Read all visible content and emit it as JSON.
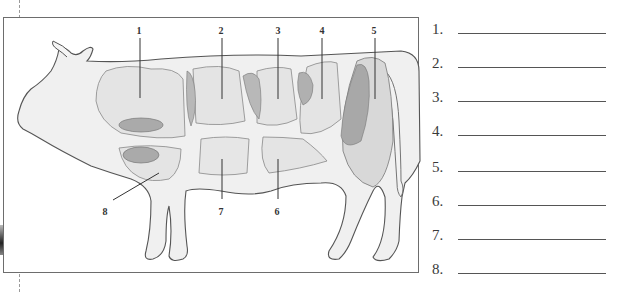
{
  "diagram": {
    "cut_labels": [
      {
        "id": "1",
        "text": "1",
        "x": 138,
        "y": 24
      },
      {
        "id": "2",
        "text": "2",
        "x": 220,
        "y": 24
      },
      {
        "id": "3",
        "text": "3",
        "x": 277,
        "y": 24
      },
      {
        "id": "4",
        "text": "4",
        "x": 321,
        "y": 24
      },
      {
        "id": "5",
        "text": "5",
        "x": 373,
        "y": 24
      },
      {
        "id": "6",
        "text": "6",
        "x": 276,
        "y": 205
      },
      {
        "id": "7",
        "text": "7",
        "x": 220,
        "y": 205
      },
      {
        "id": "8",
        "text": "8",
        "x": 104,
        "y": 205
      }
    ],
    "colors": {
      "outline": "#555555",
      "body_fill": "#efefef",
      "cut_fill": "#e2e2e2",
      "meat_fill": "#a9a9a9"
    }
  },
  "answers": {
    "rows": [
      {
        "number": "1.",
        "value": ""
      },
      {
        "number": "2.",
        "value": ""
      },
      {
        "number": "3.",
        "value": ""
      },
      {
        "number": "4.",
        "value": ""
      },
      {
        "number": "5.",
        "value": ""
      },
      {
        "number": "6.",
        "value": ""
      },
      {
        "number": "7.",
        "value": ""
      },
      {
        "number": "8.",
        "value": ""
      }
    ]
  }
}
